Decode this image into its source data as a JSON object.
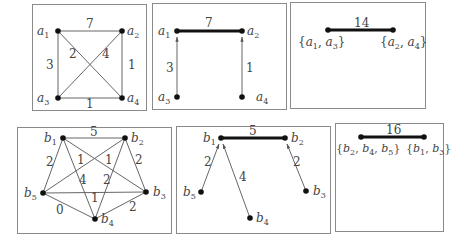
{
  "panels": {
    "a_graph": {
      "nodes": [
        {
          "id": "a1",
          "label": "a",
          "sub": "1",
          "x": 58,
          "y": 31
        },
        {
          "id": "a2",
          "label": "a",
          "sub": "2",
          "x": 122,
          "y": 31
        },
        {
          "id": "a3",
          "label": "a",
          "sub": "3",
          "x": 58,
          "y": 98
        },
        {
          "id": "a4",
          "label": "a",
          "sub": "4",
          "x": 122,
          "y": 98
        }
      ],
      "edges": [
        {
          "from": "a1",
          "to": "a2",
          "weight": "7"
        },
        {
          "from": "a1",
          "to": "a3",
          "weight": "3"
        },
        {
          "from": "a2",
          "to": "a4",
          "weight": "1"
        },
        {
          "from": "a3",
          "to": "a4",
          "weight": "1"
        },
        {
          "from": "a1",
          "to": "a4",
          "weight": "2"
        },
        {
          "from": "a3",
          "to": "a2",
          "weight": "4"
        }
      ]
    },
    "a_tree": {
      "bold_edge": {
        "from": "a1",
        "to": "a2",
        "weight": "7"
      },
      "arrows": [
        {
          "from": "a3",
          "to": "a1",
          "weight": "3"
        },
        {
          "from": "a4",
          "to": "a2",
          "weight": "1"
        }
      ],
      "labels": {
        "a1": "a",
        "a2": "a",
        "a3": "a",
        "a4": "a"
      }
    },
    "a_contracted": {
      "weight": "14",
      "left_set": "{a1, a3}",
      "right_set": "{a2, a4}"
    },
    "b_graph": {
      "nodes": [
        {
          "id": "b1",
          "x": 63,
          "y": 138
        },
        {
          "id": "b2",
          "x": 125,
          "y": 138
        },
        {
          "id": "b3",
          "x": 146,
          "y": 192
        },
        {
          "id": "b4",
          "x": 95,
          "y": 219
        },
        {
          "id": "b5",
          "x": 43,
          "y": 193
        }
      ],
      "edges": [
        {
          "from": "b1",
          "to": "b2",
          "weight": "5"
        },
        {
          "from": "b1",
          "to": "b5",
          "weight": "2"
        },
        {
          "from": "b2",
          "to": "b3",
          "weight": "2"
        },
        {
          "from": "b5",
          "to": "b2",
          "weight": "1"
        },
        {
          "from": "b1",
          "to": "b3",
          "weight": "1"
        },
        {
          "from": "b1",
          "to": "b4",
          "weight": "4"
        },
        {
          "from": "b2",
          "to": "b4",
          "weight": "2"
        },
        {
          "from": "b5",
          "to": "b3",
          "weight": "1"
        },
        {
          "from": "b5",
          "to": "b4",
          "weight": "0"
        },
        {
          "from": "b4",
          "to": "b3",
          "weight": "2"
        }
      ]
    },
    "b_tree": {
      "bold_edge": {
        "from": "b1",
        "to": "b2",
        "weight": "5"
      },
      "arrows": [
        {
          "from": "b5",
          "to": "b1",
          "weight": "2"
        },
        {
          "from": "b4",
          "to": "b1",
          "weight": "4"
        },
        {
          "from": "b3",
          "to": "b2",
          "weight": "2"
        }
      ]
    },
    "b_contracted": {
      "weight": "16",
      "left_set": "{b2, b4, b5}",
      "right_set": "{b1, b3}"
    }
  },
  "text": {
    "a": "a",
    "b": "b",
    "s1": "1",
    "s2": "2",
    "s3": "3",
    "s4": "4",
    "s5": "5",
    "w_a12": "7",
    "w_a13": "3",
    "w_a24": "1",
    "w_a34": "1",
    "w_a14": "2",
    "w_a32": "4",
    "w_t_a12": "7",
    "w_t_a31": "3",
    "w_t_a42": "1",
    "w_ac": "14",
    "w_b12": "5",
    "w_b15": "2",
    "w_b23": "2",
    "w_b52": "1",
    "w_b13": "1",
    "w_b14": "4",
    "w_b24": "2",
    "w_b53": "1",
    "w_b54": "0",
    "w_b43": "2",
    "w_t_b12": "5",
    "w_t_b51": "2",
    "w_t_b41": "4",
    "w_t_b32": "2",
    "w_bc": "16",
    "brace_open": "{",
    "brace_close": "}",
    "comma": ", "
  }
}
